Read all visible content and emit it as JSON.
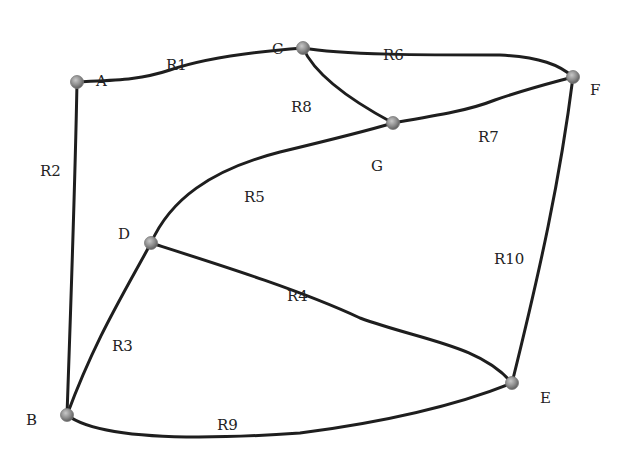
{
  "diagram": {
    "type": "road network graph",
    "nodes": [
      {
        "id": "A",
        "label": "A",
        "x": 77,
        "y": 82,
        "lx": 96,
        "ly": 72
      },
      {
        "id": "B",
        "label": "B",
        "x": 67,
        "y": 415,
        "lx": 26,
        "ly": 411
      },
      {
        "id": "C",
        "label": "C",
        "x": 303,
        "y": 48,
        "lx": 272,
        "ly": 40
      },
      {
        "id": "D",
        "label": "D",
        "x": 151,
        "y": 243,
        "lx": 118,
        "ly": 225
      },
      {
        "id": "E",
        "label": "E",
        "x": 512,
        "y": 383,
        "lx": 540,
        "ly": 389
      },
      {
        "id": "F",
        "label": "F",
        "x": 573,
        "y": 77,
        "lx": 590,
        "ly": 81
      },
      {
        "id": "G",
        "label": "G",
        "x": 393,
        "y": 123,
        "lx": 371,
        "ly": 157
      }
    ],
    "edges": [
      {
        "id": "R1",
        "label": "R1",
        "from": "A",
        "to": "C",
        "lx": 166,
        "ly": 56,
        "path": "M77 82 C 115 80, 140 80, 170 70 C 205 58, 250 52, 303 48"
      },
      {
        "id": "R2",
        "label": "R2",
        "from": "A",
        "to": "B",
        "lx": 40,
        "ly": 162,
        "path": "M77 82 C 75 190, 71 300, 67 415"
      },
      {
        "id": "R3",
        "label": "R3",
        "from": "D",
        "to": "B",
        "lx": 112,
        "ly": 337,
        "path": "M151 243 C 120 300, 95 340, 67 415"
      },
      {
        "id": "R4",
        "label": "R4",
        "from": "D",
        "to": "E",
        "lx": 287,
        "ly": 287,
        "path": "M151 243 C 220 265, 300 290, 360 318 C 420 340, 480 345, 512 383"
      },
      {
        "id": "R5",
        "label": "R5",
        "from": "D",
        "to": "G",
        "lx": 244,
        "ly": 188,
        "path": "M151 243 C 170 200, 210 170, 280 152 C 330 140, 370 130, 393 123"
      },
      {
        "id": "R6",
        "label": "R6",
        "from": "C",
        "to": "F",
        "lx": 383,
        "ly": 46,
        "path": "M303 48 C 340 55, 430 55, 500 55 C 540 57, 560 65, 573 77"
      },
      {
        "id": "R7",
        "label": "R7",
        "from": "G",
        "to": "F",
        "lx": 478,
        "ly": 128,
        "path": "M393 123 C 440 115, 470 110, 495 100 C 530 88, 555 82, 573 77"
      },
      {
        "id": "R8",
        "label": "R8",
        "from": "C",
        "to": "G",
        "lx": 291,
        "ly": 98,
        "path": "M303 48 C 315 75, 350 100, 393 123"
      },
      {
        "id": "R9",
        "label": "R9",
        "from": "B",
        "to": "E",
        "lx": 217,
        "ly": 416,
        "path": "M67 415 C 100 440, 200 440, 300 433 C 400 420, 470 400, 512 383"
      },
      {
        "id": "R10",
        "label": "R10",
        "from": "F",
        "to": "E",
        "lx": 494,
        "ly": 250,
        "path": "M573 77 C 560 180, 540 270, 512 383"
      }
    ],
    "colors": {
      "edge": "#1e1e1e",
      "node_fill": "#8c8c8c",
      "label": "#222222",
      "background": "#ffffff"
    }
  }
}
